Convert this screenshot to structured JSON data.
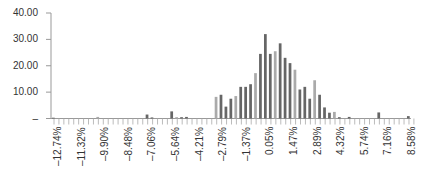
{
  "chart_data": {
    "type": "bar",
    "title": "",
    "xlabel": "",
    "ylabel": "",
    "ylim": [
      0,
      40
    ],
    "yticks": [
      "40.00",
      "30.00",
      "20.00",
      "10.00",
      "–"
    ],
    "grid": false,
    "legend": null,
    "xtick_labels": [
      "–12.74%",
      "–11.32%",
      "–9.90%",
      "–8.48%",
      "–7.06%",
      "–5.64%",
      "–4.21%",
      "–2.79%",
      "–1.37%",
      "0.05%",
      "1.47%",
      "2.89%",
      "4.32%",
      "5.74%",
      "7.16%",
      "8.58%"
    ],
    "bin_width_pct": 0.355,
    "bins_start_pct": -12.74,
    "series": [
      {
        "name": "frequency",
        "values": [
          0.3,
          0,
          0,
          0,
          0,
          0,
          0,
          0,
          0,
          0.6,
          0,
          0,
          0,
          0,
          0,
          0,
          0,
          0,
          0,
          1.5,
          0.4,
          0,
          0,
          0,
          2.7,
          0.5,
          0.5,
          0.6,
          0,
          0,
          0,
          0,
          0,
          8.2,
          9.0,
          4.5,
          7.5,
          8.5,
          12.0,
          12.0,
          13.0,
          17.2,
          24.5,
          32.0,
          24.5,
          25.5,
          28.5,
          23.0,
          21.0,
          18.5,
          11.0,
          12.0,
          7.5,
          14.5,
          9.0,
          4.2,
          2.2,
          2.5,
          0.5,
          0,
          0.6,
          0,
          0,
          0,
          0,
          0,
          2.3,
          0,
          0,
          0,
          0,
          0,
          0.9
        ],
        "shades": "alternating dark (#666) with every 4th bar light (#aaa)"
      }
    ]
  }
}
